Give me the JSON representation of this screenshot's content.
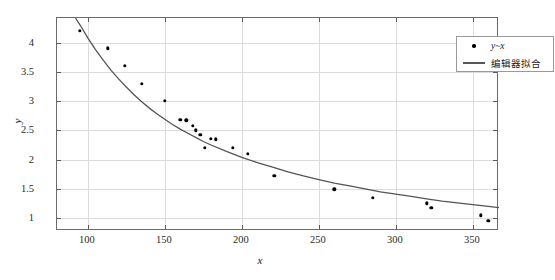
{
  "chart_data": {
    "type": "scatter",
    "title": "",
    "xlabel": "x",
    "ylabel": "y",
    "xlim": [
      80,
      367
    ],
    "ylim": [
      0.78,
      4.42
    ],
    "xticks": [
      100,
      150,
      200,
      250,
      300,
      350
    ],
    "yticks": [
      1,
      1.5,
      2,
      2.5,
      3,
      3.5,
      4
    ],
    "grid": true,
    "legend_position": "top-right",
    "series": [
      {
        "name": "y~x",
        "type": "scatter",
        "marker": "filled-circle",
        "color": "#000000",
        "points": [
          {
            "x": 95,
            "y": 4.2
          },
          {
            "x": 113,
            "y": 3.9
          },
          {
            "x": 124,
            "y": 3.6
          },
          {
            "x": 135,
            "y": 3.3
          },
          {
            "x": 150,
            "y": 3.0
          },
          {
            "x": 160,
            "y": 2.68
          },
          {
            "x": 164,
            "y": 2.67
          },
          {
            "x": 168,
            "y": 2.58
          },
          {
            "x": 170,
            "y": 2.5
          },
          {
            "x": 173,
            "y": 2.42
          },
          {
            "x": 176,
            "y": 2.2
          },
          {
            "x": 180,
            "y": 2.36
          },
          {
            "x": 183,
            "y": 2.35
          },
          {
            "x": 194,
            "y": 2.2
          },
          {
            "x": 204,
            "y": 2.1
          },
          {
            "x": 221,
            "y": 1.72
          },
          {
            "x": 260,
            "y": 1.49
          },
          {
            "x": 285,
            "y": 1.35
          },
          {
            "x": 320,
            "y": 1.25
          },
          {
            "x": 323,
            "y": 1.18
          },
          {
            "x": 355,
            "y": 1.05
          },
          {
            "x": 360,
            "y": 0.95
          }
        ]
      },
      {
        "name": "编辑器拟合",
        "type": "line",
        "color": "#555555",
        "curve": [
          {
            "x": 92,
            "y": 4.42
          },
          {
            "x": 95,
            "y": 4.3
          },
          {
            "x": 100,
            "y": 4.08
          },
          {
            "x": 105,
            "y": 3.88
          },
          {
            "x": 110,
            "y": 3.7
          },
          {
            "x": 115,
            "y": 3.53
          },
          {
            "x": 120,
            "y": 3.38
          },
          {
            "x": 125,
            "y": 3.24
          },
          {
            "x": 130,
            "y": 3.11
          },
          {
            "x": 135,
            "y": 2.99
          },
          {
            "x": 140,
            "y": 2.88
          },
          {
            "x": 145,
            "y": 2.78
          },
          {
            "x": 150,
            "y": 2.69
          },
          {
            "x": 155,
            "y": 2.6
          },
          {
            "x": 160,
            "y": 2.52
          },
          {
            "x": 165,
            "y": 2.45
          },
          {
            "x": 170,
            "y": 2.38
          },
          {
            "x": 175,
            "y": 2.31
          },
          {
            "x": 180,
            "y": 2.25
          },
          {
            "x": 190,
            "y": 2.14
          },
          {
            "x": 200,
            "y": 2.04
          },
          {
            "x": 210,
            "y": 1.95
          },
          {
            "x": 220,
            "y": 1.87
          },
          {
            "x": 230,
            "y": 1.79
          },
          {
            "x": 240,
            "y": 1.72
          },
          {
            "x": 250,
            "y": 1.66
          },
          {
            "x": 260,
            "y": 1.6
          },
          {
            "x": 270,
            "y": 1.55
          },
          {
            "x": 280,
            "y": 1.5
          },
          {
            "x": 290,
            "y": 1.45
          },
          {
            "x": 300,
            "y": 1.41
          },
          {
            "x": 310,
            "y": 1.37
          },
          {
            "x": 320,
            "y": 1.33
          },
          {
            "x": 330,
            "y": 1.29
          },
          {
            "x": 340,
            "y": 1.26
          },
          {
            "x": 350,
            "y": 1.23
          },
          {
            "x": 360,
            "y": 1.2
          },
          {
            "x": 367,
            "y": 1.18
          }
        ]
      }
    ],
    "legend": [
      {
        "label": "y~x",
        "marker": "dot",
        "italic": true
      },
      {
        "label": "编辑器拟合",
        "marker": "line",
        "italic": false
      }
    ]
  }
}
